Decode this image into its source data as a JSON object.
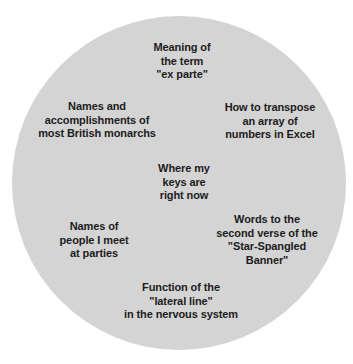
{
  "canvas": {
    "width": 353,
    "height": 364,
    "background_color": "#ffffff"
  },
  "circle": {
    "fill_color": "#d4d4d4",
    "diameter": 334,
    "center_x": 179,
    "center_y": 183
  },
  "text_style": {
    "color": "#1c1c1c",
    "font_size": 11,
    "font_weight": "bold",
    "align": "center"
  },
  "labels": [
    {
      "id": "ex-parte",
      "text": "Meaning of\nthe term\n\"ex parte\"",
      "lines": [
        "Meaning of",
        "the term",
        "\"ex parte\""
      ]
    },
    {
      "id": "monarchs",
      "text": "Names and\naccomplishments of\nmost British monarchs",
      "lines": [
        "Names and",
        "accomplishments of",
        "most British monarchs"
      ]
    },
    {
      "id": "transpose",
      "text": "How to transpose\nan array of\nnumbers in Excel",
      "lines": [
        "How to transpose",
        "an array of",
        "numbers in Excel"
      ]
    },
    {
      "id": "keys",
      "text": "Where my\nkeys are\nright now",
      "lines": [
        "Where my",
        "keys are",
        "right now"
      ]
    },
    {
      "id": "parties",
      "text": "Names of\npeople I meet\nat parties",
      "lines": [
        "Names of",
        "people I meet",
        "at parties"
      ]
    },
    {
      "id": "star-spangled",
      "text": "Words to the\nsecond verse of the\n\"Star-Spangled\nBanner\"",
      "lines": [
        "Words to the",
        "second verse of the",
        "\"Star-Spangled",
        "Banner\""
      ]
    },
    {
      "id": "lateral-line",
      "text": "Function of the\n\"lateral line\"\nin the nervous system",
      "lines": [
        "Function of the",
        "\"lateral line\"",
        "in the nervous system"
      ]
    }
  ]
}
